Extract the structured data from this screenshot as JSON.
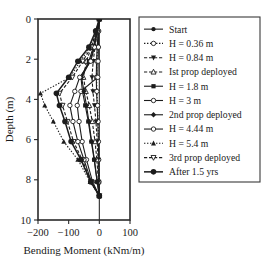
{
  "chart_data": {
    "type": "line",
    "title": "",
    "xlabel": "Bending Moment (kNm/m)",
    "ylabel": "Depth (m)",
    "xlim": [
      -200,
      100
    ],
    "ylim": [
      0,
      10
    ],
    "y_inverted": true,
    "xticks": [
      -200,
      -100,
      0,
      100
    ],
    "xticklabels": [
      "−200",
      "−100",
      "0",
      "100"
    ],
    "yticks": [
      0,
      2,
      4,
      6,
      8,
      10
    ],
    "yticklabels": [
      "0",
      "2",
      "4",
      "6",
      "8",
      "10"
    ],
    "grid": false,
    "legend_position": "right",
    "series": [
      {
        "name": "Start",
        "marker": "filled-circle",
        "line": "solid",
        "x": [
          0,
          -4,
          -7,
          -9,
          -10,
          -9,
          -7,
          -5,
          -3,
          -2,
          -1,
          0
        ],
        "y": [
          0.0,
          0.6,
          1.4,
          2.1,
          2.9,
          3.6,
          4.3,
          5.1,
          6.1,
          7.0,
          8.1,
          8.8
        ]
      },
      {
        "name": "H = 0.36 m",
        "marker": "open-circle",
        "line": "dotted",
        "x": [
          0,
          -3,
          -6,
          -8,
          -9,
          -8,
          -6,
          -4,
          -3,
          -2,
          -1,
          0
        ],
        "y": [
          0.0,
          0.6,
          1.4,
          2.1,
          2.9,
          3.6,
          4.3,
          5.1,
          6.1,
          7.0,
          8.1,
          8.8
        ]
      },
      {
        "name": "H = 0.84 m",
        "marker": "filled-down-triangle",
        "line": "dashed",
        "x": [
          0,
          -6,
          -14,
          -20,
          -24,
          -21,
          -16,
          -11,
          -7,
          -4,
          -2,
          0
        ],
        "y": [
          0.0,
          0.6,
          1.4,
          2.1,
          2.9,
          3.6,
          4.3,
          5.1,
          6.1,
          7.0,
          8.1,
          8.8
        ]
      },
      {
        "name": "Ist prop deployed",
        "marker": "open-up-triangle",
        "line": "dashed",
        "x": [
          0,
          -10,
          -26,
          -42,
          -52,
          -44,
          -33,
          -23,
          -14,
          -8,
          -3,
          0
        ],
        "y": [
          0.0,
          0.6,
          1.4,
          2.1,
          2.9,
          3.6,
          4.3,
          5.1,
          6.1,
          7.0,
          8.1,
          8.8
        ]
      },
      {
        "name": "H = 1.8 m",
        "marker": "filled-square",
        "line": "solid",
        "x": [
          0,
          -8,
          -20,
          -34,
          -60,
          -55,
          -46,
          -36,
          -26,
          -17,
          -7,
          0
        ],
        "y": [
          0.0,
          0.6,
          1.4,
          2.1,
          2.9,
          3.6,
          4.3,
          5.1,
          6.1,
          7.0,
          8.1,
          8.8
        ]
      },
      {
        "name": "H = 3 m",
        "marker": "open-circle",
        "line": "solid",
        "x": [
          0,
          -2,
          -3,
          -4,
          -5,
          -60,
          -72,
          -66,
          -56,
          -42,
          -22,
          0
        ],
        "y": [
          0.0,
          0.6,
          1.4,
          2.1,
          2.9,
          3.6,
          4.3,
          5.1,
          6.1,
          7.0,
          8.1,
          8.8
        ]
      },
      {
        "name": "2nd prop deployed",
        "marker": "filled-diamond",
        "line": "solid",
        "x": [
          0,
          -7,
          -18,
          -30,
          -58,
          -50,
          -42,
          -34,
          -25,
          -16,
          -7,
          0
        ],
        "y": [
          0.0,
          0.6,
          1.4,
          2.1,
          2.9,
          3.6,
          4.3,
          5.1,
          6.1,
          7.0,
          8.1,
          8.8
        ]
      },
      {
        "name": "H = 4.44 m",
        "marker": "open-circle",
        "line": "solid",
        "x": [
          0,
          -6,
          -16,
          -28,
          -64,
          -80,
          -96,
          -86,
          -70,
          -50,
          -26,
          0
        ],
        "y": [
          0.0,
          0.6,
          1.4,
          2.1,
          2.9,
          3.6,
          4.3,
          5.1,
          6.1,
          7.0,
          8.1,
          8.8
        ]
      },
      {
        "name": "H = 5.4 m",
        "marker": "filled-up-triangle",
        "line": "dotted",
        "x": [
          0,
          -10,
          -30,
          -62,
          -96,
          -192,
          -178,
          -150,
          -116,
          -70,
          -30,
          0
        ],
        "y": [
          0.0,
          0.6,
          1.4,
          2.1,
          2.9,
          3.7,
          4.3,
          5.1,
          6.1,
          7.0,
          8.1,
          8.8
        ]
      },
      {
        "name": "3rd prop deployed",
        "marker": "open-down-triangle",
        "line": "dashed",
        "x": [
          0,
          -9,
          -26,
          -54,
          -88,
          -130,
          -120,
          -104,
          -84,
          -56,
          -26,
          0
        ],
        "y": [
          0.0,
          0.6,
          1.4,
          2.1,
          2.9,
          3.7,
          4.3,
          5.1,
          6.1,
          7.0,
          8.1,
          8.8
        ]
      },
      {
        "name": "After 1.5 yrs",
        "marker": "filled-circle-large",
        "line": "solid",
        "x": [
          0,
          -12,
          -34,
          -70,
          -100,
          -140,
          -130,
          -112,
          -92,
          -60,
          -28,
          0
        ],
        "y": [
          0.0,
          0.6,
          1.4,
          2.1,
          2.9,
          3.7,
          4.3,
          5.1,
          6.1,
          7.0,
          8.1,
          8.8
        ]
      }
    ]
  }
}
